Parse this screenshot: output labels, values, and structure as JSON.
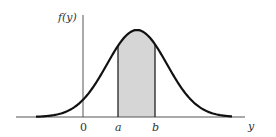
{
  "chart_data": {
    "type": "area",
    "title": "",
    "ylabel": "f(y)",
    "xlabel": "y",
    "tick_labels": [
      "0",
      "a",
      "b"
    ],
    "shaded_region": {
      "from": "a",
      "to": "b",
      "color": "#d6d6d6"
    },
    "curve": {
      "shape": "normal",
      "color": "#111111",
      "peak_px": {
        "x": 137,
        "y": 30
      }
    },
    "grid": false,
    "legend": null,
    "layout_px": {
      "axis_y": 117,
      "x_axis_start": 16,
      "x_axis_end": 245,
      "y_axis_x": 83,
      "y_axis_top": 15,
      "a_x": 118,
      "b_x": 155
    }
  },
  "labels": {
    "y_axis": "f(y)",
    "x_axis": "y",
    "origin": "0",
    "a": "a",
    "b": "b"
  }
}
